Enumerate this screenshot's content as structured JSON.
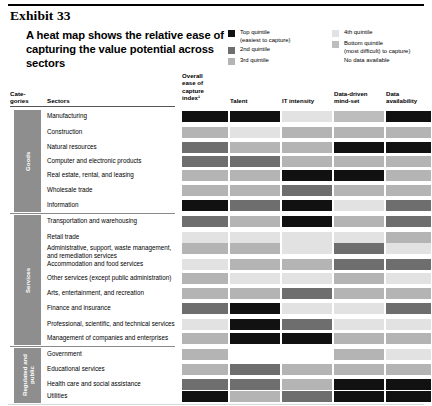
{
  "exhibit": {
    "label": "Exhibit 33"
  },
  "headline": {
    "text": "A heat map shows the relative ease of capturing the value potential across sectors"
  },
  "legend": {
    "column1": [
      {
        "swatch": "#111111",
        "label": "Top quintile",
        "sub": "(easiest to capture)"
      },
      {
        "swatch": "#6e6e6e",
        "label": "2nd quintile",
        "sub": ""
      },
      {
        "swatch": "#b4b4b4",
        "label": "3rd quintile",
        "sub": ""
      }
    ],
    "column2": [
      {
        "swatch": "#e2e2e2",
        "label": "4th quintile",
        "sub": ""
      },
      {
        "swatch": "#bdbdbd",
        "label": "Bottom quintile",
        "sub": "(most difficult) to capture)"
      },
      {
        "swatch": "#ffffff",
        "label": "No data available",
        "sub": ""
      }
    ]
  },
  "table": {
    "categories_header": "Cate-\ngories",
    "categories_header_line1": "Cate-",
    "categories_header_line2": "gories",
    "sectors_header": "Sectors",
    "columns": [
      {
        "id": "overall",
        "lines": [
          "Overall",
          "ease of",
          "capture",
          "index¹"
        ]
      },
      {
        "id": "talent",
        "lines": [
          "Talent"
        ]
      },
      {
        "id": "it_intensity",
        "lines": [
          "IT intensity"
        ]
      },
      {
        "id": "mindset",
        "lines": [
          "Data-driven",
          "mind-set"
        ]
      },
      {
        "id": "data_availability",
        "lines": [
          "Data",
          "availability"
        ]
      }
    ],
    "groups": [
      {
        "name": "Goods",
        "rows": 7
      },
      {
        "name": "Services",
        "rows": 9
      },
      {
        "name": "Regulated and public",
        "rows": 4
      }
    ],
    "rows": [
      {
        "group": "Goods",
        "sector": "Manufacturing",
        "values": [
          "top",
          "top",
          "q4",
          "bottom",
          "top"
        ]
      },
      {
        "group": "Goods",
        "sector": "Construction",
        "values": [
          "q3",
          "q4",
          "q3",
          "q3",
          "q3"
        ]
      },
      {
        "group": "Goods",
        "sector": "Natural resources",
        "values": [
          "2nd",
          "q3",
          "q3",
          "top",
          "top"
        ]
      },
      {
        "group": "Goods",
        "sector": "Computer and electronic products",
        "values": [
          "2nd",
          "2nd",
          "q3",
          "q3",
          "q3"
        ]
      },
      {
        "group": "Goods",
        "sector": "Real estate, rental, and leasing",
        "values": [
          "q3",
          "q3",
          "top",
          "top",
          "q3"
        ]
      },
      {
        "group": "Goods",
        "sector": "Wholesale trade",
        "values": [
          "q3",
          "q3",
          "2nd",
          "q3",
          "q3"
        ]
      },
      {
        "group": "Goods",
        "sector": "Information",
        "values": [
          "top",
          "2nd",
          "top",
          "q4",
          "2nd"
        ]
      },
      {
        "group": "Services",
        "sector": "Transportation and warehousing",
        "values": [
          "2nd",
          "q3",
          "top",
          "q3",
          "2nd"
        ]
      },
      {
        "group": "Services",
        "sector": "Retail trade",
        "values": [
          "q4",
          "q4",
          "q4",
          "q4",
          "q3"
        ]
      },
      {
        "group": "Services",
        "sector": "Administrative, support, waste management, and remediation services",
        "values": [
          "q3",
          "q3",
          "q4",
          "2nd",
          "q4"
        ]
      },
      {
        "group": "Services",
        "sector": "Accommodation and food services",
        "values": [
          "q4",
          "q3",
          "q3",
          "2nd",
          "2nd"
        ]
      },
      {
        "group": "Services",
        "sector": "Other services (except public administration)",
        "values": [
          "q3",
          "q4",
          "q4",
          "q3",
          "q4"
        ]
      },
      {
        "group": "Services",
        "sector": "Arts, entertainment, and recreation",
        "values": [
          "q3",
          "q3",
          "2nd",
          "q3",
          "q3"
        ]
      },
      {
        "group": "Services",
        "sector": "Finance and insurance",
        "values": [
          "2nd",
          "top",
          "q4",
          "q4",
          "2nd"
        ]
      },
      {
        "group": "Services",
        "sector": "Professional, scientific, and technical services",
        "values": [
          "q4",
          "top",
          "2nd",
          "q4",
          "q4"
        ]
      },
      {
        "group": "Services",
        "sector": "Management of companies and enterprises",
        "values": [
          "q3",
          "top",
          "top",
          "q3",
          "q3"
        ]
      },
      {
        "group": "Regulated and public",
        "sector": "Government",
        "values": [
          "q3",
          "nodata",
          "nodata",
          "q3",
          "q4"
        ]
      },
      {
        "group": "Regulated and public",
        "sector": "Educational services",
        "values": [
          "q3",
          "2nd",
          "q3",
          "q3",
          "q3"
        ]
      },
      {
        "group": "Regulated and public",
        "sector": "Health care and social assistance",
        "values": [
          "2nd",
          "2nd",
          "q3",
          "top",
          "top"
        ]
      },
      {
        "group": "Regulated and public",
        "sector": "Utilities",
        "values": [
          "top",
          "q3",
          "2nd",
          "top",
          "top"
        ]
      }
    ]
  },
  "colors": {
    "top": "#111111",
    "2nd": "#6e6e6e",
    "q3": "#b4b4b4",
    "q4": "#e2e2e2",
    "bottom": "#bdbdbd",
    "nodata": "#ffffff",
    "groupbar": "#8e8e8e"
  }
}
